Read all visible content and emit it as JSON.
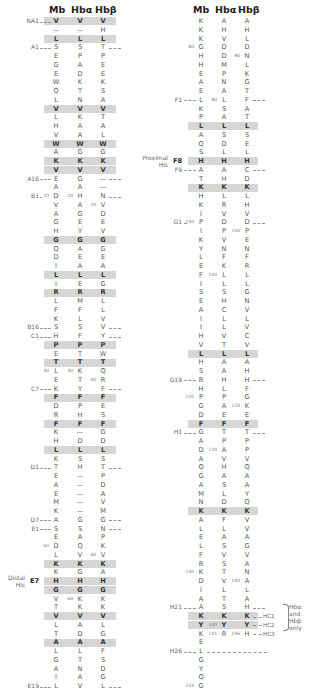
{
  "headers": [
    "Mb",
    "Hbα",
    "Hbβ"
  ],
  "left_column": {
    "rows": [
      {
        "mb": "V",
        "ha": "V",
        "hb": "V",
        "shade": true,
        "label": "NA1",
        "dashL": true,
        "mbn": "",
        "han": "",
        "hbn": ""
      },
      {
        "mb": "—",
        "ha": "—",
        "hb": "H"
      },
      {
        "mb": "L",
        "ha": "L",
        "hb": "L",
        "shade": true
      },
      {
        "mb": "S",
        "ha": "S",
        "hb": "T",
        "label": "A1",
        "dashL": true,
        "dashR": true
      },
      {
        "mb": "E",
        "ha": "P",
        "hb": "P"
      },
      {
        "mb": "G",
        "ha": "A",
        "hb": "E"
      },
      {
        "mb": "E",
        "ha": "D",
        "hb": "E"
      },
      {
        "mb": "W",
        "ha": "K",
        "hb": "K"
      },
      {
        "mb": "Q",
        "ha": "T",
        "hb": "S"
      },
      {
        "mb": "L",
        "ha": "N",
        "hb": "A"
      },
      {
        "mb": "V",
        "ha": "V",
        "hb": "V",
        "shade": true
      },
      {
        "mb": "L",
        "ha": "K",
        "hb": "T"
      },
      {
        "mb": "H",
        "ha": "A",
        "hb": "A"
      },
      {
        "mb": "V",
        "ha": "A",
        "hb": "L"
      },
      {
        "mb": "W",
        "ha": "W",
        "hb": "W",
        "shade": true
      },
      {
        "mb": "A",
        "ha": "G",
        "hb": "G"
      },
      {
        "mb": "K",
        "ha": "K",
        "hb": "K",
        "shade": true
      },
      {
        "mb": "V",
        "ha": "V",
        "hb": "V",
        "shade": true
      },
      {
        "mb": "E",
        "ha": "G",
        "hb": "—",
        "label": "A16",
        "dashL": true,
        "dashR": true
      },
      {
        "mb": "A",
        "ha": "A",
        "hb": "—"
      },
      {
        "mb": "D",
        "ha": "H",
        "hb": "N",
        "label": "B1",
        "dashL": true,
        "dashR": true,
        "mbn": "20",
        "han": "20"
      },
      {
        "mb": "V",
        "ha": "A",
        "hb": "V",
        "hbn": "20"
      },
      {
        "mb": "A",
        "ha": "G",
        "hb": "D"
      },
      {
        "mb": "G",
        "ha": "E",
        "hb": "E"
      },
      {
        "mb": "H",
        "ha": "Y",
        "hb": "V"
      },
      {
        "mb": "G",
        "ha": "G",
        "hb": "G",
        "shade": true
      },
      {
        "mb": "Q",
        "ha": "A",
        "hb": "G"
      },
      {
        "mb": "D",
        "ha": "E",
        "hb": "E"
      },
      {
        "mb": "I",
        "ha": "A",
        "hb": "A"
      },
      {
        "mb": "L",
        "ha": "L",
        "hb": "L",
        "shade": true
      },
      {
        "mb": "I",
        "ha": "E",
        "hb": "G"
      },
      {
        "mb": "R",
        "ha": "R",
        "hb": "R",
        "shade": true
      },
      {
        "mb": "L",
        "ha": "M",
        "hb": "L"
      },
      {
        "mb": "F",
        "ha": "F",
        "hb": "L"
      },
      {
        "mb": "K",
        "ha": "L",
        "hb": "V"
      },
      {
        "mb": "S",
        "ha": "S",
        "hb": "V",
        "label": "B16",
        "dashL": true,
        "dashR": true
      },
      {
        "mb": "H",
        "ha": "F",
        "hb": "Y",
        "label": "C1",
        "dashL": true,
        "dashR": true
      },
      {
        "mb": "P",
        "ha": "P",
        "hb": "P",
        "shade": true
      },
      {
        "mb": "E",
        "ha": "T",
        "hb": "W"
      },
      {
        "mb": "T",
        "ha": "T",
        "hb": "T",
        "shade": true
      },
      {
        "mb": "L",
        "ha": "K",
        "hb": "Q",
        "mbn": "40",
        "han": "40"
      },
      {
        "mb": "E",
        "ha": "T",
        "hb": "R",
        "hbn": "40"
      },
      {
        "mb": "K",
        "ha": "Y",
        "hb": "F",
        "label": "C7",
        "dashL": true,
        "dashR": true
      },
      {
        "mb": "F",
        "ha": "F",
        "hb": "F",
        "shade": true
      },
      {
        "mb": "D",
        "ha": "P",
        "hb": "E"
      },
      {
        "mb": "R",
        "ha": "H",
        "hb": "S"
      },
      {
        "mb": "F",
        "ha": "F",
        "hb": "F",
        "shade": true
      },
      {
        "mb": "K",
        "ha": "—",
        "hb": "G"
      },
      {
        "mb": "H",
        "ha": "D",
        "hb": "D"
      },
      {
        "mb": "L",
        "ha": "L",
        "hb": "L",
        "shade": true
      },
      {
        "mb": "K",
        "ha": "S",
        "hb": "S"
      },
      {
        "mb": "T",
        "ha": "H",
        "hb": "T",
        "label": "D1",
        "dashL": true,
        "dashR": true
      },
      {
        "mb": "E",
        "ha": "—",
        "hb": "P"
      },
      {
        "mb": "A",
        "ha": "—",
        "hb": "D"
      },
      {
        "mb": "E",
        "ha": "—",
        "hb": "A"
      },
      {
        "mb": "M",
        "ha": "—",
        "hb": "V"
      },
      {
        "mb": "K",
        "ha": "—",
        "hb": "M"
      },
      {
        "mb": "A",
        "ha": "G",
        "hb": "G",
        "label": "D7",
        "dashL": true,
        "dashR": true
      },
      {
        "mb": "S",
        "ha": "S",
        "hb": "N",
        "label": "E1",
        "dashL": true,
        "dashR": true
      },
      {
        "mb": "E",
        "ha": "A",
        "hb": "P"
      },
      {
        "mb": "D",
        "ha": "Q",
        "hb": "K",
        "mbn": "60"
      },
      {
        "mb": "L",
        "ha": "V",
        "hb": "V",
        "hbn": "60"
      },
      {
        "mb": "K",
        "ha": "K",
        "hb": "K",
        "shade": true
      },
      {
        "mb": "K",
        "ha": "G",
        "hb": "A"
      },
      {
        "mb": "H",
        "ha": "H",
        "hb": "H",
        "shade": true,
        "label": "E7",
        "labelBold": true
      },
      {
        "mb": "G",
        "ha": "G",
        "hb": "G",
        "shade": true
      },
      {
        "mb": "V",
        "ha": "K",
        "hb": "K",
        "han": "60"
      },
      {
        "mb": "T",
        "ha": "K",
        "hb": "K"
      },
      {
        "mb": "V",
        "ha": "V",
        "hb": "V",
        "shade": true
      },
      {
        "mb": "L",
        "ha": "A",
        "hb": "L"
      },
      {
        "mb": "T",
        "ha": "D",
        "hb": "G"
      },
      {
        "mb": "A",
        "ha": "A",
        "hb": "A",
        "shade": true
      },
      {
        "mb": "L",
        "ha": "L",
        "hb": "F"
      },
      {
        "mb": "G",
        "ha": "T",
        "hb": "S"
      },
      {
        "mb": "A",
        "ha": "N",
        "hb": "D"
      },
      {
        "mb": "I",
        "ha": "A",
        "hb": "G"
      },
      {
        "mb": "L",
        "ha": "V",
        "hb": "L",
        "label": "E19",
        "dashL": true,
        "dashR": true
      }
    ],
    "side_label": {
      "line1": "Distal",
      "line2": "His"
    }
  },
  "right_column": {
    "rows": [
      {
        "mb": "K",
        "ha": "A",
        "hb": "A"
      },
      {
        "mb": "K",
        "ha": "H",
        "hb": "H"
      },
      {
        "mb": "K",
        "ha": "V",
        "hb": "L"
      },
      {
        "mb": "G",
        "ha": "D",
        "hb": "D",
        "mbn": "80"
      },
      {
        "mb": "H",
        "ha": "D",
        "hb": "N",
        "hbn": "80"
      },
      {
        "mb": "H",
        "ha": "M",
        "hb": "L"
      },
      {
        "mb": "E",
        "ha": "P",
        "hb": "K"
      },
      {
        "mb": "A",
        "ha": "N",
        "hb": "G"
      },
      {
        "mb": "E",
        "ha": "A",
        "hb": "T"
      },
      {
        "mb": "L",
        "ha": "L",
        "hb": "F",
        "label": "F1",
        "dashL": true,
        "dashR": true,
        "han": "80"
      },
      {
        "mb": "K",
        "ha": "S",
        "hb": "A"
      },
      {
        "mb": "P",
        "ha": "A",
        "hb": "T"
      },
      {
        "mb": "L",
        "ha": "L",
        "hb": "L",
        "shade": true
      },
      {
        "mb": "A",
        "ha": "S",
        "hb": "S"
      },
      {
        "mb": "Q",
        "ha": "D",
        "hb": "E"
      },
      {
        "mb": "S",
        "ha": "L",
        "hb": "L"
      },
      {
        "mb": "H",
        "ha": "H",
        "hb": "H",
        "shade": true,
        "label": "F8",
        "labelBold": true
      },
      {
        "mb": "A",
        "ha": "A",
        "hb": "C",
        "label": "F9",
        "dashL": true,
        "dashR": true
      },
      {
        "mb": "T",
        "ha": "H",
        "hb": "D"
      },
      {
        "mb": "K",
        "ha": "K",
        "hb": "K",
        "shade": true
      },
      {
        "mb": "H",
        "ha": "L",
        "hb": "L"
      },
      {
        "mb": "K",
        "ha": "R",
        "hb": "H"
      },
      {
        "mb": "I",
        "ha": "V",
        "hb": "V"
      },
      {
        "mb": "P",
        "ha": "D",
        "hb": "D",
        "label": "G1",
        "dashL": true,
        "dashR": true,
        "mbn": "100"
      },
      {
        "mb": "I",
        "ha": "P",
        "hb": "P",
        "hbn": "100"
      },
      {
        "mb": "K",
        "ha": "V",
        "hb": "E"
      },
      {
        "mb": "Y",
        "ha": "N",
        "hb": "N"
      },
      {
        "mb": "L",
        "ha": "F",
        "hb": "F"
      },
      {
        "mb": "E",
        "ha": "K",
        "hb": "R"
      },
      {
        "mb": "F",
        "ha": "L",
        "hb": "L",
        "han": "100"
      },
      {
        "mb": "I",
        "ha": "L",
        "hb": "L"
      },
      {
        "mb": "S",
        "ha": "S",
        "hb": "G"
      },
      {
        "mb": "E",
        "ha": "H",
        "hb": "N"
      },
      {
        "mb": "A",
        "ha": "C",
        "hb": "V"
      },
      {
        "mb": "I",
        "ha": "L",
        "hb": "L"
      },
      {
        "mb": "I",
        "ha": "L",
        "hb": "V"
      },
      {
        "mb": "H",
        "ha": "V",
        "hb": "C"
      },
      {
        "mb": "V",
        "ha": "T",
        "hb": "V"
      },
      {
        "mb": "L",
        "ha": "L",
        "hb": "L",
        "shade": true
      },
      {
        "mb": "H",
        "ha": "A",
        "hb": "A"
      },
      {
        "mb": "S",
        "ha": "A",
        "hb": "H"
      },
      {
        "mb": "R",
        "ha": "H",
        "hb": "H",
        "label": "G19",
        "dashL": true,
        "dashR": true
      },
      {
        "mb": "H",
        "ha": "L",
        "hb": "F"
      },
      {
        "mb": "P",
        "ha": "P",
        "hb": "G",
        "mbn": "120"
      },
      {
        "mb": "G",
        "ha": "A",
        "hb": "K",
        "hbn": "120"
      },
      {
        "mb": "D",
        "ha": "E",
        "hb": "E"
      },
      {
        "mb": "F",
        "ha": "F",
        "hb": "F",
        "shade": true
      },
      {
        "mb": "G",
        "ha": "T",
        "hb": "T",
        "label": "H1",
        "dashL": true,
        "dashR": true
      },
      {
        "mb": "A",
        "ha": "P",
        "hb": "P"
      },
      {
        "mb": "D",
        "ha": "A",
        "hb": "P",
        "han": "120"
      },
      {
        "mb": "A",
        "ha": "V",
        "hb": "V"
      },
      {
        "mb": "Q",
        "ha": "H",
        "hb": "Q"
      },
      {
        "mb": "G",
        "ha": "A",
        "hb": "A"
      },
      {
        "mb": "A",
        "ha": "S",
        "hb": "A"
      },
      {
        "mb": "M",
        "ha": "L",
        "hb": "Y"
      },
      {
        "mb": "N",
        "ha": "D",
        "hb": "Q"
      },
      {
        "mb": "K",
        "ha": "K",
        "hb": "K",
        "shade": true
      },
      {
        "mb": "A",
        "ha": "F",
        "hb": "V"
      },
      {
        "mb": "L",
        "ha": "L",
        "hb": "V"
      },
      {
        "mb": "E",
        "ha": "A",
        "hb": "A"
      },
      {
        "mb": "L",
        "ha": "S",
        "hb": "G"
      },
      {
        "mb": "F",
        "ha": "V",
        "hb": "V"
      },
      {
        "mb": "R",
        "ha": "S",
        "hb": "A"
      },
      {
        "mb": "K",
        "ha": "T",
        "hb": "N",
        "mbn": "140"
      },
      {
        "mb": "D",
        "ha": "V",
        "hb": "A",
        "hbn": "140"
      },
      {
        "mb": "I",
        "ha": "L",
        "hb": "L"
      },
      {
        "mb": "A",
        "ha": "T",
        "hb": "A"
      },
      {
        "mb": "A",
        "ha": "S",
        "hb": "H",
        "label": "H21",
        "dashL": true,
        "dashR": true
      },
      {
        "mb": "K",
        "ha": "K",
        "hb": "K",
        "shade": true,
        "hc": "HC1"
      },
      {
        "mb": "Y",
        "ha": "Y",
        "hb": "Y",
        "shade": true,
        "hc": "HC2",
        "han": "140"
      },
      {
        "mb": "K",
        "ha": "R",
        "hb": "H",
        "hc": "HC3",
        "han": "141",
        "hbn": "146"
      },
      {
        "mb": "E",
        "ha": "",
        "hb": ""
      },
      {
        "mb": "L",
        "ha": "",
        "hb": "",
        "label": "H26",
        "dashL": true,
        "dashLong": true
      },
      {
        "mb": "G",
        "ha": "",
        "hb": ""
      },
      {
        "mb": "Y",
        "ha": "",
        "hb": ""
      },
      {
        "mb": "Q",
        "ha": "",
        "hb": ""
      },
      {
        "mb": "G",
        "ha": "",
        "hb": "",
        "mbn": "153"
      }
    ],
    "side_label": {
      "line1": "Proximal",
      "line2": "His"
    },
    "hc_note": {
      "line1": "Hbα",
      "line2": "and",
      "line3": "Hbβ",
      "line4": "only"
    }
  }
}
